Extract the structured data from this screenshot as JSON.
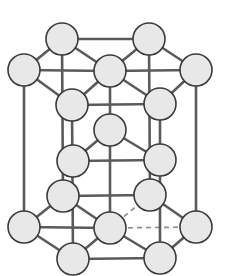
{
  "figure": {
    "background_color": "#ffffff",
    "atom_fill_color": "#e8e8e8",
    "atom_stroke_color": "#3a3a3a",
    "bond_color": "#5a5a5a",
    "hidden_bond_color": "#8f8f8f",
    "atom_radius": 16,
    "atom_count": 17,
    "bond_count": 34,
    "hidden_bond_count": 4
  },
  "layers": [
    {
      "name": "top-face",
      "label": "Top hexagonal face",
      "atom_count": 7
    },
    {
      "name": "middle-layer",
      "label": "Interior middle layer",
      "atom_count": 3
    },
    {
      "name": "bottom-face",
      "label": "Bottom hexagonal face",
      "atom_count": 7
    }
  ],
  "atoms": [
    {
      "id": "top-back-left",
      "layer": "top-face",
      "cx": 62,
      "cy": 39,
      "r": 16
    },
    {
      "id": "top-back-right",
      "layer": "top-face",
      "cx": 149,
      "cy": 39,
      "r": 16
    },
    {
      "id": "top-left",
      "layer": "top-face",
      "cx": 24,
      "cy": 70,
      "r": 16
    },
    {
      "id": "top-center",
      "layer": "top-face",
      "cx": 110,
      "cy": 71,
      "r": 16
    },
    {
      "id": "top-right",
      "layer": "top-face",
      "cx": 196,
      "cy": 70,
      "r": 16
    },
    {
      "id": "top-front-left",
      "layer": "top-face",
      "cx": 72,
      "cy": 105,
      "r": 16
    },
    {
      "id": "top-front-right",
      "layer": "top-face",
      "cx": 160,
      "cy": 104,
      "r": 16
    },
    {
      "id": "mid-center",
      "layer": "middle-layer",
      "cx": 110,
      "cy": 130,
      "r": 16
    },
    {
      "id": "mid-left",
      "layer": "middle-layer",
      "cx": 73,
      "cy": 161,
      "r": 16
    },
    {
      "id": "mid-right",
      "layer": "middle-layer",
      "cx": 160,
      "cy": 160,
      "r": 16
    },
    {
      "id": "bot-back-left",
      "layer": "bottom-face",
      "cx": 63,
      "cy": 196,
      "r": 16
    },
    {
      "id": "bot-back-right",
      "layer": "bottom-face",
      "cx": 150,
      "cy": 195,
      "r": 16
    },
    {
      "id": "bot-left",
      "layer": "bottom-face",
      "cx": 24,
      "cy": 227,
      "r": 16
    },
    {
      "id": "bot-center",
      "layer": "bottom-face",
      "cx": 110,
      "cy": 228,
      "r": 16
    },
    {
      "id": "bot-right",
      "layer": "bottom-face",
      "cx": 196,
      "cy": 227,
      "r": 16
    },
    {
      "id": "bot-front-left",
      "layer": "bottom-face",
      "cx": 73,
      "cy": 259,
      "r": 16
    },
    {
      "id": "bot-front-right",
      "layer": "bottom-face",
      "cx": 160,
      "cy": 258,
      "r": 16
    }
  ],
  "bonds": [
    {
      "from": "top-back-left",
      "to": "top-back-right",
      "style": "solid"
    },
    {
      "from": "top-back-left",
      "to": "top-left",
      "style": "solid"
    },
    {
      "from": "top-back-right",
      "to": "top-right",
      "style": "solid"
    },
    {
      "from": "top-left",
      "to": "top-front-left",
      "style": "solid"
    },
    {
      "from": "top-right",
      "to": "top-front-right",
      "style": "solid"
    },
    {
      "from": "top-front-left",
      "to": "top-front-right",
      "style": "solid"
    },
    {
      "from": "top-center",
      "to": "top-back-left",
      "style": "solid"
    },
    {
      "from": "top-center",
      "to": "top-back-right",
      "style": "solid"
    },
    {
      "from": "top-center",
      "to": "top-left",
      "style": "solid"
    },
    {
      "from": "top-center",
      "to": "top-right",
      "style": "solid"
    },
    {
      "from": "top-center",
      "to": "top-front-left",
      "style": "solid"
    },
    {
      "from": "top-center",
      "to": "top-front-right",
      "style": "solid"
    },
    {
      "from": "bot-back-left",
      "to": "bot-back-right",
      "style": "solid"
    },
    {
      "from": "bot-back-left",
      "to": "bot-left",
      "style": "solid"
    },
    {
      "from": "bot-back-right",
      "to": "bot-right",
      "style": "solid"
    },
    {
      "from": "bot-left",
      "to": "bot-front-left",
      "style": "solid"
    },
    {
      "from": "bot-right",
      "to": "bot-front-right",
      "style": "solid"
    },
    {
      "from": "bot-front-left",
      "to": "bot-front-right",
      "style": "solid"
    },
    {
      "from": "bot-center",
      "to": "bot-back-left",
      "style": "solid"
    },
    {
      "from": "bot-center",
      "to": "bot-left",
      "style": "solid"
    },
    {
      "from": "bot-center",
      "to": "bot-front-left",
      "style": "solid"
    },
    {
      "from": "bot-center",
      "to": "bot-front-right",
      "style": "solid"
    },
    {
      "from": "bot-center",
      "to": "bot-back-right",
      "style": "hidden"
    },
    {
      "from": "bot-center",
      "to": "bot-right",
      "style": "hidden"
    },
    {
      "from": "top-back-left",
      "to": "bot-back-left",
      "style": "solid"
    },
    {
      "from": "top-back-right",
      "to": "bot-back-right",
      "style": "solid"
    },
    {
      "from": "top-left",
      "to": "bot-left",
      "style": "solid"
    },
    {
      "from": "top-right",
      "to": "bot-right",
      "style": "solid"
    },
    {
      "from": "top-front-left",
      "to": "bot-front-left",
      "style": "solid"
    },
    {
      "from": "top-front-right",
      "to": "bot-front-right",
      "style": "solid"
    },
    {
      "from": "top-center",
      "to": "bot-center",
      "style": "solid"
    },
    {
      "from": "mid-center",
      "to": "mid-left",
      "style": "solid"
    },
    {
      "from": "mid-center",
      "to": "mid-right",
      "style": "solid"
    },
    {
      "from": "mid-left",
      "to": "mid-right",
      "style": "solid"
    }
  ]
}
